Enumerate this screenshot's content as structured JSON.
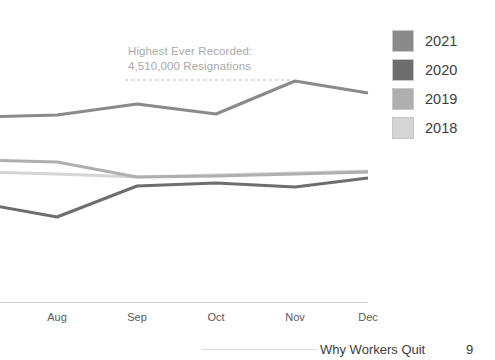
{
  "annotation": {
    "line1": "Highest Ever Recorded:",
    "line2": "4,510,000 Resignations",
    "color": "#a9a9a9"
  },
  "legend": {
    "items": [
      {
        "label": "2021",
        "color": "#8a8a8a"
      },
      {
        "label": "2020",
        "color": "#6e6e6e"
      },
      {
        "label": "2019",
        "color": "#afafaf"
      },
      {
        "label": "2018",
        "color": "#d5d5d5"
      }
    ]
  },
  "footer": {
    "title": "Why Workers Quit",
    "page": "9"
  },
  "chart_data": {
    "type": "line",
    "title": "",
    "subtitle": "",
    "xlabel": "",
    "ylabel": "",
    "grid": false,
    "legend_position": "right",
    "categories": [
      "Jul",
      "Aug",
      "Sep",
      "Oct",
      "Nov",
      "Dec"
    ],
    "tick_labels_visible": [
      "Aug",
      "Sep",
      "Oct",
      "Nov",
      "Dec"
    ],
    "x_pixels": [
      -21,
      57,
      137,
      216,
      295,
      368
    ],
    "ylim": [
      2200000,
      4700000
    ],
    "annotation_threshold": 4510000,
    "annotation_text": "Highest Ever Recorded: 4,510,000 Resignations",
    "series": [
      {
        "name": "2021",
        "color": "#8a8a8a",
        "values": [
          4020000,
          4040000,
          4270000,
          4060000,
          4510000,
          4320000
        ],
        "y_pixels": [
          117,
          115,
          104,
          114,
          81,
          93
        ]
      },
      {
        "name": "2020",
        "color": "#6e6e6e",
        "values": [
          3000000,
          2740000,
          3320000,
          3370000,
          3280000,
          3420000
        ],
        "y_pixels": [
          203,
          217,
          186,
          183,
          187,
          178
        ]
      },
      {
        "name": "2019",
        "color": "#afafaf",
        "values": [
          3520000,
          3500000,
          3400000,
          3410000,
          3440000,
          3480000
        ],
        "y_pixels": [
          160,
          162,
          177,
          176,
          174,
          172
        ]
      },
      {
        "name": "2018",
        "color": "#d5d5d5",
        "values": [
          3400000,
          3380000,
          3400000,
          3420000,
          3450000,
          3490000
        ],
        "y_pixels": [
          172,
          174,
          177,
          175,
          173,
          171
        ]
      }
    ]
  }
}
